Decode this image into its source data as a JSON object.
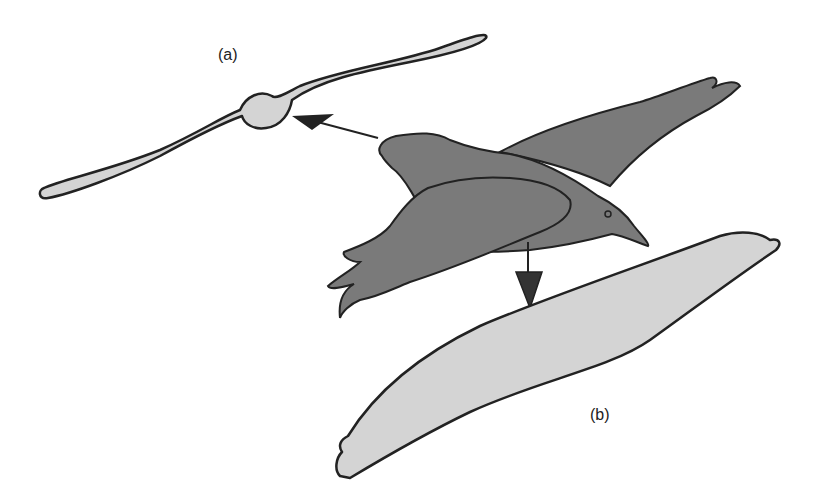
{
  "figure": {
    "labels": {
      "a": "(a)",
      "b": "(b)"
    },
    "panels": [
      {
        "id": "a",
        "description": "front view silhouette of bird gliding, viewed head-on in direction of arrow"
      },
      {
        "id": "b",
        "description": "top-down silhouette of bird wing planform, viewed from above in direction of arrow"
      }
    ],
    "colors": {
      "bird_fill": "#7a7a7a",
      "silhouette_fill": "#d4d4d4",
      "outline": "#222222",
      "background": "#ffffff"
    }
  }
}
